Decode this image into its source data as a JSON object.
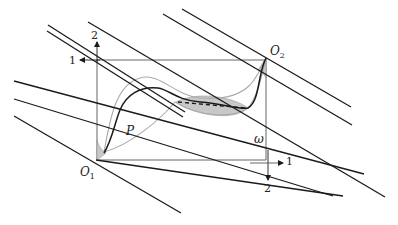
{
  "diagram": {
    "colors": {
      "line": "#1a1a1a",
      "frame": "#555555",
      "gray_curve": "#aaaaaa",
      "shade": "#c8c8c8",
      "background": "#ffffff"
    },
    "labels": {
      "o1": "O",
      "o1_sub": "1",
      "o2": "O",
      "o2_sub": "2",
      "p": "P",
      "omega": "ω",
      "left_axis_up": "2",
      "top_axis_left": "1",
      "right_axis_down": "2",
      "bottom_axis_right": "1"
    },
    "points": {
      "O1": [
        97,
        160
      ],
      "O2": [
        266,
        58
      ],
      "omega": [
        258,
        145
      ]
    },
    "parallel_lines": [
      {
        "name": "line-a",
        "x1": 48,
        "y1": 25,
        "x2": 185,
        "y2": 112
      },
      {
        "name": "line-b",
        "x1": 47,
        "y1": 30,
        "x2": 183,
        "y2": 116
      },
      {
        "name": "line-c",
        "x1": 88,
        "y1": 22,
        "x2": 383,
        "y2": 210
      },
      {
        "name": "line-d",
        "x1": 163,
        "y1": 14,
        "x2": 352,
        "y2": 125
      },
      {
        "name": "line-e",
        "x1": 182,
        "y1": 10,
        "x2": 351,
        "y2": 108
      },
      {
        "name": "line-f",
        "x1": 14,
        "y1": 99,
        "x2": 333,
        "y2": 195
      },
      {
        "name": "line-g",
        "x1": 14,
        "y1": 116,
        "x2": 352,
        "y2": 194
      }
    ],
    "transverse_line": {
      "x1": 14,
      "y1": 81,
      "x2": 364,
      "y2": 174
    }
  }
}
